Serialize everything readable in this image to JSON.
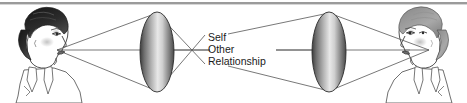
{
  "figure": {
    "name": "perception-lens-diagram",
    "top_rule": {
      "color": "#9a9a9a",
      "present": true
    },
    "background_color": "#ffffff",
    "line_color": "#4a4a4a",
    "text_color": "#1a1a1a"
  },
  "labels": [
    {
      "id": "self",
      "text": "Self"
    },
    {
      "id": "other",
      "text": "Other"
    },
    {
      "id": "relationship",
      "text": "Relationship"
    }
  ],
  "figures": {
    "left": {
      "name": "left-person-profile",
      "facing": "right"
    },
    "right": {
      "name": "right-person-profile",
      "facing": "left"
    }
  },
  "lenses": [
    {
      "id": "left-lens",
      "cx": 157,
      "cy": 52,
      "rx": 17,
      "ry": 40
    },
    {
      "id": "right-lens",
      "cx": 329,
      "cy": 52,
      "rx": 17,
      "ry": 40
    }
  ],
  "focal_point": {
    "x": 193,
    "y": 50
  }
}
